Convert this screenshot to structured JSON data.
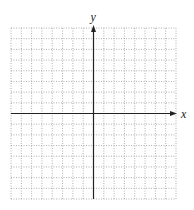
{
  "chart_data": {
    "type": "scatter",
    "title": "",
    "xlabel": "x",
    "ylabel": "y",
    "grid": true,
    "grid_style": "dotted",
    "grid_cells": {
      "columns": 16,
      "rows": 16
    },
    "xlim": [
      -8,
      8
    ],
    "ylim": [
      -8,
      8
    ],
    "x_ticks_labeled": [],
    "y_ticks_labeled": [],
    "series": []
  },
  "axes": {
    "x_label": "x",
    "y_label": "y"
  },
  "colors": {
    "grid": "#9a9a9a",
    "axis": "#222222",
    "background": "#ffffff"
  }
}
